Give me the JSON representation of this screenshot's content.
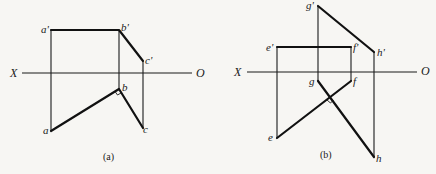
{
  "diagram": {
    "type": "orthographic-projection",
    "panels": [
      {
        "caption": "(a)",
        "axis": {
          "left_label": "X",
          "right_label": "O"
        },
        "points": {
          "a_prime": "a'",
          "b_prime": "b'",
          "c_prime": "c'",
          "a": "a",
          "b": "b",
          "c": "c"
        },
        "right_angle_at": "b"
      },
      {
        "caption": "(b)",
        "axis": {
          "left_label": "X",
          "right_label": "O"
        },
        "points": {
          "e_prime": "e'",
          "f_prime": "f'",
          "g_prime": "g'",
          "h_prime": "h'",
          "e": "e",
          "f": "f",
          "g": "g",
          "h": "h"
        },
        "right_angle_at": "intersection of ef and gh"
      }
    ]
  }
}
